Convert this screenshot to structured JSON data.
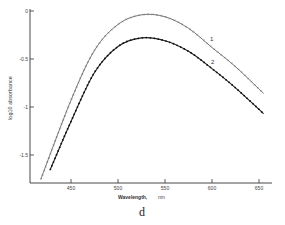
{
  "chart_data": {
    "type": "line",
    "title": "",
    "caption": "d",
    "xlabel": "Wavelength,",
    "xunit": "nm",
    "ylabel": "log10 absorbance",
    "xlim": [
      410,
      660
    ],
    "ylim": [
      -1.8,
      0
    ],
    "xticks": [
      450,
      500,
      550,
      600,
      650
    ],
    "yticks": [
      0,
      -0.5,
      -1,
      -1.5
    ],
    "ytick_labels": [
      "0",
      "-0.5",
      "-1",
      "-1.5"
    ],
    "grid": false,
    "legend": "inline labels",
    "x": [
      418,
      450,
      475,
      500,
      525,
      550,
      575,
      600,
      625,
      655
    ],
    "series": [
      {
        "name": "1",
        "marker": "cross",
        "values": [
          -1.75,
          -0.93,
          -0.41,
          -0.14,
          -0.04,
          -0.06,
          -0.18,
          -0.38,
          -0.58,
          -0.86
        ]
      },
      {
        "name": "2",
        "marker": "filled-dot",
        "x": [
          428,
          450,
          475,
          500,
          525,
          550,
          575,
          600,
          625,
          655
        ],
        "values": [
          -1.65,
          -1.15,
          -0.64,
          -0.37,
          -0.28,
          -0.31,
          -0.42,
          -0.6,
          -0.8,
          -1.07
        ]
      }
    ]
  },
  "labels": {
    "series1": "1",
    "series2": "2",
    "xlabel": "Wavelength,",
    "xunit": "nm",
    "ylabel": "log10 absorbance",
    "caption": "d"
  }
}
